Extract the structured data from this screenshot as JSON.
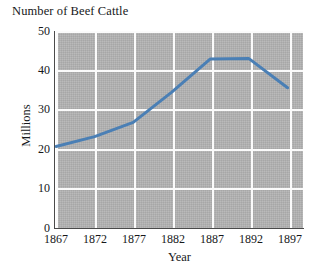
{
  "chart_data": {
    "type": "line",
    "title": "Number of Beef Cattle",
    "xlabel": "Year",
    "ylabel": "Millions",
    "xlim": [
      1867,
      1899
    ],
    "ylim": [
      0,
      50
    ],
    "xticks": [
      1867,
      1872,
      1877,
      1882,
      1887,
      1892,
      1897
    ],
    "xtick_labels": [
      "1867",
      "1872",
      "1877",
      "1882",
      "1887",
      "1892",
      "1897"
    ],
    "yticks": [
      0,
      10,
      20,
      30,
      40,
      50
    ],
    "ytick_labels": [
      "0",
      "10",
      "20",
      "30",
      "40",
      "50"
    ],
    "grid": true,
    "legend": "none",
    "plot_bgcolor": "#b2b2b2",
    "gridcolor": "#fbfbfb",
    "line_color": "#4a7fb5",
    "line_width": 3,
    "x": [
      1867,
      1872,
      1877,
      1882,
      1887,
      1892,
      1897
    ],
    "values": [
      20.7,
      23.2,
      26.8,
      34.5,
      42.9,
      43.0,
      35.6
    ],
    "series": [
      {
        "name": "Beef cattle",
        "values": [
          20.7,
          23.2,
          26.8,
          34.5,
          42.9,
          43.0,
          35.6
        ]
      }
    ]
  },
  "axis": {
    "ytick_labels": [
      "50",
      "40",
      "30",
      "20",
      "10",
      "0"
    ],
    "xtick_labels": [
      "1867",
      "1872",
      "1877",
      "1882",
      "1887",
      "1892",
      "1897"
    ]
  }
}
